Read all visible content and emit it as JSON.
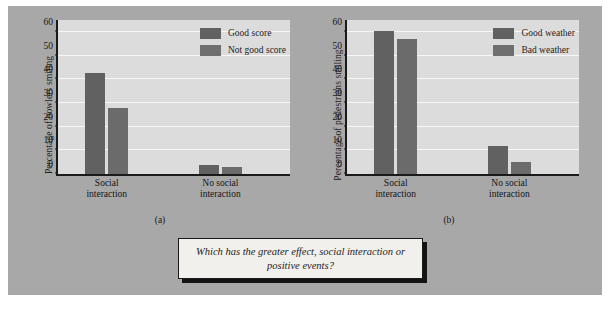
{
  "figure": {
    "background_color": "#a8a8a8",
    "question_box": {
      "text": "Which has the greater effect, social interaction or positive events?",
      "background_color": "#f2f0ec",
      "shadow_color": "#141414"
    },
    "subcaption_a": "(a)",
    "subcaption_b": "(b)"
  },
  "chart_data": [
    {
      "id": "a",
      "type": "bar",
      "title": "",
      "xlabel": "",
      "ylabel": "Percentage of bowlers smiling",
      "categories": [
        "Social interaction",
        "No social interaction"
      ],
      "category_lines": [
        [
          "Social",
          "interaction"
        ],
        [
          "No social",
          "interaction"
        ]
      ],
      "series": [
        {
          "name": "Good score",
          "values": [
            42.5,
            4
          ]
        },
        {
          "name": "Not good score",
          "values": [
            28,
            3
          ]
        }
      ],
      "ylim": [
        0,
        65
      ],
      "yticks": [
        0,
        10,
        20,
        30,
        40,
        50,
        60
      ],
      "ytick_labels": [
        "0",
        "10",
        "20",
        "30",
        "40",
        "50",
        "60"
      ],
      "grid": true,
      "legend_position": "top-right",
      "bar_colors": [
        "#616161",
        "#6b6b6b"
      ],
      "plot_background": "#dcdcdc"
    },
    {
      "id": "b",
      "type": "bar",
      "title": "",
      "xlabel": "",
      "ylabel": "Percentage of pedestrians smiling",
      "categories": [
        "Social interaction",
        "No social interaction"
      ],
      "category_lines": [
        [
          "Social",
          "interaction"
        ],
        [
          "No social",
          "interaction"
        ]
      ],
      "series": [
        {
          "name": "Good weather",
          "values": [
            60.5,
            12
          ]
        },
        {
          "name": "Bad weather",
          "values": [
            57,
            5
          ]
        }
      ],
      "ylim": [
        0,
        65
      ],
      "yticks": [
        0,
        10,
        20,
        30,
        40,
        50,
        60
      ],
      "ytick_labels": [
        "0",
        "10",
        "20",
        "30",
        "40",
        "50",
        "60"
      ],
      "grid": true,
      "legend_position": "top-right",
      "bar_colors": [
        "#616161",
        "#6b6b6b"
      ],
      "plot_background": "#dcdcdc"
    }
  ]
}
